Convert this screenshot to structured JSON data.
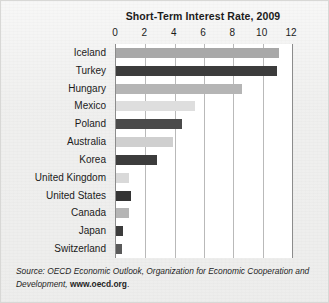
{
  "chart_data": {
    "type": "bar",
    "orientation": "horizontal",
    "title": "Short-Term Interest Rate, 2009",
    "xlabel": "",
    "ylabel": "",
    "xlim": [
      0,
      12
    ],
    "xticks": [
      0,
      2,
      4,
      6,
      8,
      10,
      12
    ],
    "xtick_labels": [
      "0",
      "2",
      "4",
      "6",
      "8",
      "10",
      "12"
    ],
    "grid": true,
    "legend": "none",
    "categories": [
      "Iceland",
      "Turkey",
      "Hungary",
      "Mexico",
      "Poland",
      "Australia",
      "Korea",
      "United Kingdom",
      "United States",
      "Canada",
      "Japan",
      "Switzerland"
    ],
    "values": [
      11.1,
      11.0,
      8.6,
      5.4,
      4.5,
      3.9,
      2.8,
      0.9,
      1.0,
      0.9,
      0.5,
      0.4
    ],
    "bar_colors": [
      "#a8a8a8",
      "#3c3c3c",
      "#b5b5b5",
      "#dedede",
      "#4a4a4a",
      "#cfcfcf",
      "#3c3c3c",
      "#d9d9d9",
      "#343434",
      "#b5b5b5",
      "#3c3c3c",
      "#5a5a5a"
    ]
  },
  "source": {
    "prefix": "Source: OECD Economic Outlook, Organization for Economic Cooperation and Development, ",
    "url": "www.oecd.org",
    "suffix": "."
  },
  "colors": {
    "page_background": "#eeeeed",
    "plot_background": "#ffffff",
    "axis": "#8c8c8c",
    "gridline": "#b9b9b9",
    "text": "#1b1b1b"
  }
}
